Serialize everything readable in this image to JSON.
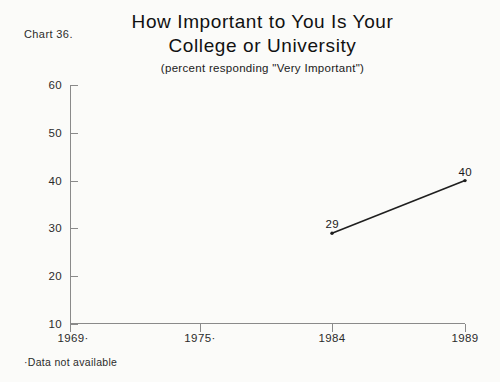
{
  "chart_number": "Chart 36.",
  "footnote": "·Data not available",
  "chart_data": {
    "type": "line",
    "title": "How Important to You Is Your College or University",
    "title_lines": [
      "How Important to You Is Your",
      "College or University"
    ],
    "subtitle": "(percent responding \"Very Important\")",
    "xlabel": "",
    "ylabel": "",
    "categories": [
      "1969·",
      "1975·",
      "1984",
      "1989"
    ],
    "x": [
      1969,
      1975,
      1984,
      1989
    ],
    "values": [
      null,
      null,
      29,
      40
    ],
    "point_labels": [
      "",
      "",
      "29",
      "40"
    ],
    "ylim": [
      10,
      60
    ],
    "yticks": [
      10,
      20,
      30,
      40,
      50,
      60
    ],
    "ytick_labels": [
      "10",
      "20",
      "30",
      "40",
      "50",
      "60"
    ],
    "grid": false,
    "legend": "none",
    "line_color": "#1f1f1f",
    "series": [
      {
        "name": "Percent responding Very Important",
        "points": [
          {
            "category": "1984",
            "value": 29,
            "label": "29"
          },
          {
            "category": "1989",
            "value": 40,
            "label": "40"
          }
        ]
      }
    ]
  }
}
